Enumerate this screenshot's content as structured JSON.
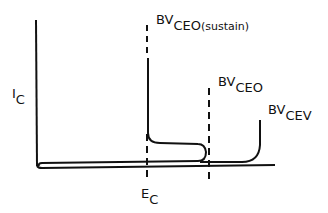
{
  "diagram": {
    "type": "transistor breakdown voltage characteristic",
    "y_axis_label": {
      "main": "I",
      "sub": "C"
    },
    "x_marker_label": {
      "main": "E",
      "sub": "C"
    },
    "curves": [
      {
        "id": "bvceo-sustain",
        "label_main": "BV",
        "label_sub": "CEO",
        "label_suffix": "(sustain)"
      },
      {
        "id": "bvceo",
        "label_main": "BV",
        "label_sub": "CEO"
      },
      {
        "id": "bvcev",
        "label_main": "BV",
        "label_sub": "CEV"
      }
    ],
    "colors": {
      "line": "#111111",
      "background": "#ffffff"
    }
  }
}
